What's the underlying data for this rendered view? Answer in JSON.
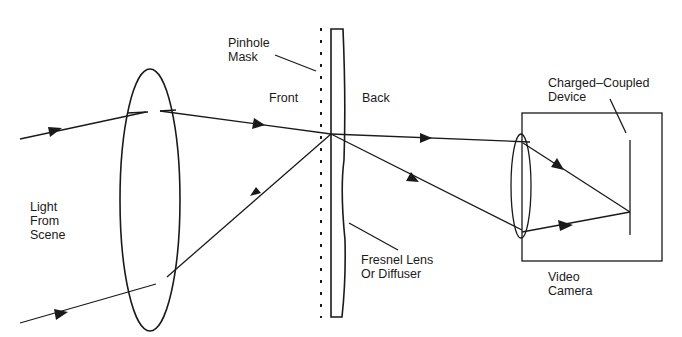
{
  "diagram": {
    "type": "optical-setup",
    "labels": {
      "pinhole_mask": "Pinhole\nMask",
      "front": "Front",
      "back": "Back",
      "ccd": "Charged–Coupled\nDevice",
      "light_from_scene": "Light\nFrom\nScene",
      "fresnel": "Fresnel Lens\nOr Diffuser",
      "video_camera": "Video\nCamera"
    },
    "colors": {
      "line": "#1a1a1a",
      "background": "#ffffff"
    }
  }
}
